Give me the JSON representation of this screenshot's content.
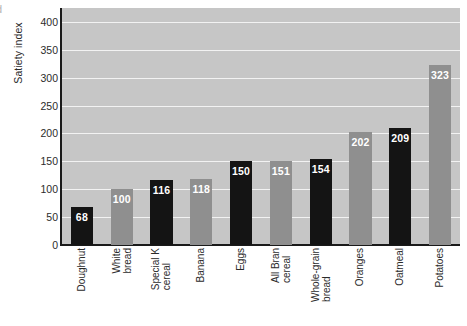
{
  "crop_remnant_text": "d",
  "chart_data": {
    "type": "bar",
    "title": "",
    "xlabel": "",
    "ylabel": "Satiety index",
    "ylim": [
      0,
      425
    ],
    "grid": true,
    "legend": "none",
    "yticks": [
      0,
      50,
      100,
      150,
      200,
      250,
      300,
      350,
      400
    ],
    "categories": [
      "Doughnut",
      "White bread",
      "Special K cereal",
      "Banana",
      "Eggs",
      "All Bran cereal",
      "Whole-grain bread",
      "Oranges",
      "Oatmeal",
      "Potatoes"
    ],
    "category_lines": [
      [
        "Doughnut",
        ""
      ],
      [
        "White",
        "bread"
      ],
      [
        "Special K",
        "cereal"
      ],
      [
        "Banana",
        ""
      ],
      [
        "Eggs",
        ""
      ],
      [
        "All Bran",
        "cereal"
      ],
      [
        "Whole-grain",
        "bread"
      ],
      [
        "Oranges",
        ""
      ],
      [
        "Oatmeal",
        ""
      ],
      [
        "Potatoes",
        ""
      ]
    ],
    "values": [
      68,
      100,
      116,
      118,
      150,
      151,
      154,
      202,
      209,
      323
    ],
    "value_labels": [
      "68",
      "100",
      "116",
      "118",
      "150",
      "151",
      "154",
      "202",
      "209",
      "323"
    ],
    "bar_colors": [
      "#141414",
      "#8f8f8f",
      "#141414",
      "#8f8f8f",
      "#141414",
      "#8f8f8f",
      "#141414",
      "#8f8f8f",
      "#141414",
      "#8f8f8f"
    ],
    "plot_background": "#c6c6c6",
    "gridline_color": "#f2f2f2",
    "axis_color": "#1a1a1a",
    "value_label_color": "#ffffff"
  }
}
